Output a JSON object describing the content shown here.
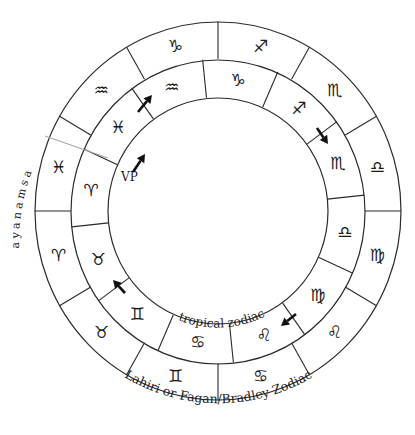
{
  "diagram": {
    "center": [
      218,
      211
    ],
    "y_scale": 1.035,
    "radii": {
      "outer": 183,
      "middle": 147,
      "inner": 110
    },
    "outer_ring": {
      "name": "Lahiri or Fagan/Bradley Zodiac",
      "boundary_offset_deg": 0,
      "signs": [
        {
          "name": "Libra",
          "glyph": "♎",
          "angle": 15
        },
        {
          "name": "Scorpio",
          "glyph": "♏",
          "angle": 45
        },
        {
          "name": "Sagittarius",
          "glyph": "♐",
          "angle": 75
        },
        {
          "name": "Capricorn",
          "glyph": "♑",
          "angle": 105
        },
        {
          "name": "Aquarius",
          "glyph": "♒",
          "angle": 135
        },
        {
          "name": "Pisces",
          "glyph": "♓",
          "angle": 165
        },
        {
          "name": "Aries",
          "glyph": "♈",
          "angle": 195
        },
        {
          "name": "Taurus",
          "glyph": "♉",
          "angle": 225
        },
        {
          "name": "Gemini",
          "glyph": "♊",
          "angle": 255
        },
        {
          "name": "Cancer",
          "glyph": "♋",
          "angle": 285
        },
        {
          "name": "Leo",
          "glyph": "♌",
          "angle": 315
        },
        {
          "name": "Virgo",
          "glyph": "♍",
          "angle": 345
        }
      ]
    },
    "middle_ring": {
      "name": "tropical zodiac",
      "boundary_offset_deg": 6,
      "signs": [
        {
          "name": "Libra",
          "glyph": "♎",
          "angle": -9
        },
        {
          "name": "Scorpio",
          "glyph": "♏",
          "angle": 21
        },
        {
          "name": "Sagittarius",
          "glyph": "♐",
          "angle": 51
        },
        {
          "name": "Capricorn",
          "glyph": "♑",
          "angle": 81
        },
        {
          "name": "Aquarius",
          "glyph": "♒",
          "angle": 111
        },
        {
          "name": "Pisces",
          "glyph": "♓",
          "angle": 141
        },
        {
          "name": "Aries",
          "glyph": "♈",
          "angle": 171
        },
        {
          "name": "Taurus",
          "glyph": "♉",
          "angle": 201
        },
        {
          "name": "Gemini",
          "glyph": "♊",
          "angle": 231
        },
        {
          "name": "Cancer",
          "glyph": "♋",
          "angle": 261
        },
        {
          "name": "Leo",
          "glyph": "♌",
          "angle": 291
        },
        {
          "name": "Virgo",
          "glyph": "♍",
          "angle": 321
        }
      ]
    },
    "arrows": [
      {
        "name": "arrow-capricorn-aquarius",
        "x1": 138,
        "y1": 112,
        "x2": 152,
        "y2": 95
      },
      {
        "name": "arrow-sagittarius-scorpio",
        "x1": 317,
        "y1": 128,
        "x2": 328,
        "y2": 144
      },
      {
        "name": "arrow-leo-virgo",
        "x1": 296,
        "y1": 314,
        "x2": 281,
        "y2": 326
      },
      {
        "name": "arrow-taurus-gemini",
        "x1": 125,
        "y1": 293,
        "x2": 113,
        "y2": 280
      },
      {
        "name": "arrow-vernal-point",
        "x1": 133,
        "y1": 172,
        "x2": 145,
        "y2": 154
      }
    ],
    "labels": {
      "vernal_point": "VP",
      "ayanamsa": "ayanamsa",
      "tropical": "tropical zodiac",
      "sidereal": "Lahiri or Fagan/Bradley Zodiac"
    },
    "colors": {
      "line": "#2a2a2a",
      "ayanamsa_line": "#a8a8a8",
      "text": "#1a1a1a",
      "background": "#ffffff"
    }
  }
}
